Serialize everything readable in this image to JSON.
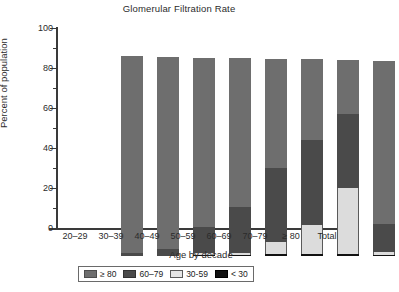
{
  "chart_data": {
    "type": "bar",
    "subtype": "stacked-bar-100",
    "title": "Glomerular Filtration Rate",
    "xlabel": "Age by decade",
    "ylabel": "Percent of population",
    "ylim": [
      0,
      100
    ],
    "yticks": [
      0,
      20,
      40,
      60,
      80,
      100
    ],
    "ytick_labels": [
      "0",
      "20",
      "40",
      "60",
      "80",
      "100"
    ],
    "yminor_ticks": [
      10,
      30,
      50,
      70,
      90
    ],
    "grid": false,
    "legend_position": "bottom",
    "categories": [
      "20–29",
      "30–39",
      "40–49",
      "50–59",
      "60–69",
      "70–79",
      "≥ 80",
      "Total"
    ],
    "stack_order_bottom_to_top": [
      "< 30",
      "30-59",
      "60–79",
      "≥ 80"
    ],
    "series": [
      {
        "name": "< 30",
        "color": "#111111",
        "values": [
          0.0,
          0.0,
          0.5,
          0.5,
          0.8,
          1.0,
          1.0,
          0.5
        ]
      },
      {
        "name": "30-59",
        "color": "#dcdcdc",
        "values": [
          0.0,
          0.0,
          0.8,
          1.0,
          6.2,
          14.5,
          33.0,
          1.5
        ]
      },
      {
        "name": "60–79",
        "color": "#4a4a4a",
        "values": [
          1.3,
          3.5,
          13.0,
          23.0,
          37.0,
          42.5,
          37.0,
          14.0
        ]
      },
      {
        "name": "≥ 80",
        "color": "#6e6e6e",
        "values": [
          98.7,
          95.8,
          84.8,
          74.6,
          54.7,
          40.4,
          27.2,
          81.5
        ]
      }
    ],
    "bar_totals": [
      100.0,
      99.3,
      99.1,
      99.1,
      98.7,
      98.4,
      98.2,
      97.5
    ]
  },
  "legend": {
    "items": [
      {
        "label": "≥ 80",
        "swatch": "ge80"
      },
      {
        "label": "60–79",
        "swatch": "6079"
      },
      {
        "label": "30-59",
        "swatch": "3059"
      },
      {
        "label": "< 30",
        "swatch": "lt30"
      }
    ]
  }
}
